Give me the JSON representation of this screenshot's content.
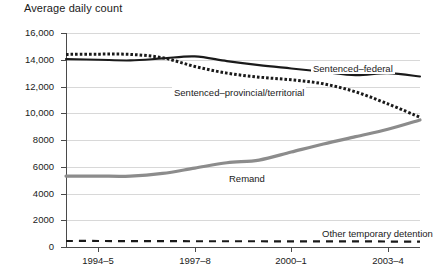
{
  "chart_data": {
    "type": "line",
    "title": "Average daily count",
    "xlabel": "",
    "ylabel": "",
    "ylim": [
      0,
      16000
    ],
    "grid": true,
    "legend_position": "inline-annotations",
    "yticks": [
      0,
      2000,
      4000,
      6000,
      8000,
      10000,
      12000,
      14000,
      16000
    ],
    "ytick_labels": [
      "0",
      "2000",
      "4000",
      "6000",
      "8000",
      "10,000",
      "12,000",
      "14,000",
      "16,000"
    ],
    "x": [
      "1993-4",
      "1994-5",
      "1995-6",
      "1996-7",
      "1997-8",
      "1998-9",
      "1999-0",
      "2000-1",
      "2001-2",
      "2002-3",
      "2003-4",
      "2004-5"
    ],
    "xtick_labels": [
      "1994–5",
      "1997–8",
      "2000–1",
      "2003–4"
    ],
    "xtick_indices": [
      1,
      4,
      7,
      10
    ],
    "series": [
      {
        "name": "Sentenced–federal",
        "style": "solid",
        "color": "#1a1a1a",
        "label_x_index": 7.6,
        "label_y": 13300,
        "values": [
          14050,
          14000,
          13950,
          14100,
          14250,
          13900,
          13600,
          13350,
          13100,
          12850,
          13000,
          12750
        ]
      },
      {
        "name": "Sentenced–provincial/territorial",
        "style": "dotted",
        "color": "#1a1a1a",
        "label_x_index": 3.3,
        "label_y": 11550,
        "values": [
          14400,
          14420,
          14400,
          14150,
          13500,
          13000,
          12700,
          12500,
          12200,
          11600,
          10700,
          9700
        ]
      },
      {
        "name": "Remand",
        "style": "solid-thick",
        "color": "#8c8c8c",
        "label_x_index": 5.0,
        "label_y": 5100,
        "values": [
          5300,
          5300,
          5300,
          5500,
          5900,
          6300,
          6500,
          7100,
          7700,
          8250,
          8800,
          9500
        ]
      },
      {
        "name": "Other temporary detention",
        "style": "dashed",
        "color": "#1a1a1a",
        "label_x_index": 7.9,
        "label_y": 1000,
        "values": [
          450,
          450,
          440,
          440,
          430,
          430,
          430,
          420,
          420,
          420,
          410,
          400
        ]
      }
    ]
  }
}
